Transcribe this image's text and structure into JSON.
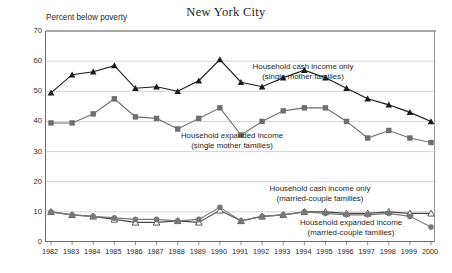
{
  "chart_data": {
    "type": "line",
    "title": "New York City",
    "xlabel": "",
    "ylabel": "Percent below poverty",
    "ylim": [
      0,
      70
    ],
    "yticks": [
      0,
      10,
      20,
      30,
      40,
      50,
      60,
      70
    ],
    "grid": true,
    "legend_position": "inline-annotations",
    "categories": [
      "1982",
      "1983",
      "1984",
      "1985",
      "1986",
      "1987",
      "1988",
      "1989",
      "1990",
      "1991",
      "1992",
      "1993",
      "1994",
      "1995",
      "1996",
      "1997",
      "1998",
      "1999",
      "2000"
    ],
    "series": [
      {
        "name": "Household cash income only (single mother families)",
        "marker": "filled-triangle",
        "color": "#1a1a1a",
        "values": [
          49.5,
          55.5,
          56.5,
          58.5,
          51.0,
          51.5,
          50.0,
          53.5,
          60.5,
          53.0,
          51.5,
          54.5,
          57.0,
          54.5,
          51.0,
          47.5,
          45.5,
          43.0,
          40.0
        ]
      },
      {
        "name": "Household expanded income (single mother families)",
        "marker": "filled-square",
        "color": "#6e6e6e",
        "values": [
          39.5,
          39.5,
          42.5,
          47.5,
          41.5,
          41.0,
          37.5,
          41.0,
          44.5,
          35.5,
          40.0,
          43.5,
          44.5,
          44.5,
          40.0,
          34.5,
          37.0,
          34.5,
          33.0
        ]
      },
      {
        "name": "Household cash income only (married-couple families)",
        "marker": "open-triangle",
        "color": "#4a4a4a",
        "values": [
          10.0,
          9.0,
          8.5,
          7.5,
          6.5,
          6.5,
          7.0,
          6.5,
          10.5,
          7.0,
          8.5,
          9.0,
          10.0,
          10.0,
          9.5,
          9.5,
          10.0,
          9.5,
          9.5
        ]
      },
      {
        "name": "Household expanded income (married-couple families)",
        "marker": "filled-circle",
        "color": "#777777",
        "values": [
          10.0,
          9.0,
          8.5,
          8.0,
          7.5,
          7.5,
          7.0,
          7.5,
          11.5,
          7.0,
          8.5,
          9.0,
          10.0,
          9.5,
          9.0,
          9.0,
          9.5,
          8.5,
          5.0
        ]
      }
    ],
    "annotations": [
      {
        "id": "ann-cash-single",
        "line1": "Household cash income only",
        "line2": "(single mother families)"
      },
      {
        "id": "ann-exp-single",
        "line1": "Household expanded income",
        "line2": "(single mother families)"
      },
      {
        "id": "ann-cash-married",
        "line1": "Household cash income only",
        "line2": "(married-couple families)"
      },
      {
        "id": "ann-exp-married",
        "line1": "Household expanded income",
        "line2": "(married-couple families)"
      }
    ]
  }
}
